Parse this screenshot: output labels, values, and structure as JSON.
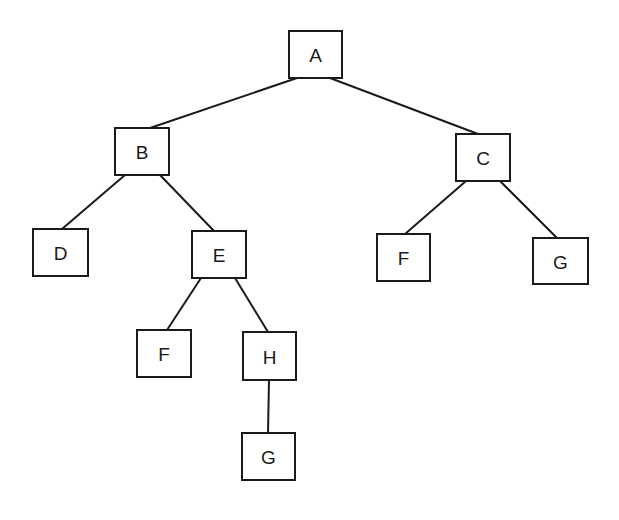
{
  "diagram": {
    "type": "binary-tree",
    "colors": {
      "stroke": "#1a1a1a",
      "background": "#ffffff"
    },
    "nodes": [
      {
        "id": "A",
        "label": "A",
        "x": 289,
        "y": 31,
        "w": 53,
        "h": 47
      },
      {
        "id": "B",
        "label": "B",
        "x": 115,
        "y": 128,
        "w": 54,
        "h": 47
      },
      {
        "id": "C",
        "label": "C",
        "x": 456,
        "y": 134,
        "w": 54,
        "h": 47
      },
      {
        "id": "D",
        "label": "D",
        "x": 33,
        "y": 229,
        "w": 55,
        "h": 47
      },
      {
        "id": "E",
        "label": "E",
        "x": 192,
        "y": 231,
        "w": 54,
        "h": 47
      },
      {
        "id": "F1",
        "label": "F",
        "x": 137,
        "y": 330,
        "w": 54,
        "h": 47
      },
      {
        "id": "H",
        "label": "H",
        "x": 243,
        "y": 332,
        "w": 53,
        "h": 48
      },
      {
        "id": "G1",
        "label": "G",
        "x": 242,
        "y": 433,
        "w": 53,
        "h": 47
      },
      {
        "id": "F2",
        "label": "F",
        "x": 377,
        "y": 234,
        "w": 53,
        "h": 47
      },
      {
        "id": "G2",
        "label": "G",
        "x": 533,
        "y": 238,
        "w": 55,
        "h": 46
      }
    ],
    "edges": [
      {
        "from": "A",
        "to": "B",
        "x1": 297,
        "y1": 78,
        "x2": 150,
        "y2": 128
      },
      {
        "from": "A",
        "to": "C",
        "x1": 330,
        "y1": 78,
        "x2": 478,
        "y2": 134
      },
      {
        "from": "B",
        "to": "D",
        "x1": 125,
        "y1": 175,
        "x2": 62,
        "y2": 229
      },
      {
        "from": "B",
        "to": "E",
        "x1": 160,
        "y1": 175,
        "x2": 214,
        "y2": 231
      },
      {
        "from": "E",
        "to": "F1",
        "x1": 201,
        "y1": 278,
        "x2": 167,
        "y2": 330
      },
      {
        "from": "E",
        "to": "H",
        "x1": 235,
        "y1": 278,
        "x2": 268,
        "y2": 332
      },
      {
        "from": "H",
        "to": "G1",
        "x1": 269,
        "y1": 380,
        "x2": 268,
        "y2": 433
      },
      {
        "from": "C",
        "to": "F2",
        "x1": 466,
        "y1": 181,
        "x2": 405,
        "y2": 234
      },
      {
        "from": "C",
        "to": "G2",
        "x1": 500,
        "y1": 181,
        "x2": 557,
        "y2": 238
      }
    ]
  }
}
